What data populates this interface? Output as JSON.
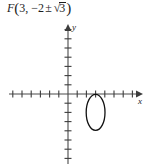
{
  "figure": {
    "annotation": {
      "function_name": "F",
      "open_paren": "(",
      "x_coordinate": "3",
      "separator": ", ",
      "y_base": "−2",
      "plus_minus": "±",
      "radical_sign": "√",
      "radicand": "3",
      "close_paren": ")",
      "full_text": "F(3, −2 ± √3)"
    },
    "axes": {
      "x_axis_label": "x",
      "y_axis_label": "y",
      "origin_px": {
        "x": 68,
        "y": 94
      },
      "tick_spacing_px": 9.2,
      "x_ticks_left": 7,
      "x_ticks_right": 7,
      "y_ticks_above": 7,
      "y_ticks_below": 7,
      "x_range": [
        -7,
        7
      ],
      "y_range": [
        -7,
        7
      ],
      "arrowheads": [
        "x-positive",
        "y-positive"
      ],
      "grid": false,
      "tick_labels_shown": false
    },
    "curve": {
      "type": "ellipse",
      "center": [
        3,
        -2
      ],
      "semi_major_axis_vertical": 2,
      "semi_minor_axis_horizontal": 1,
      "orientation": "vertical",
      "foci": [
        "(3, -2 + √3)",
        "(3, -2 - √3)"
      ],
      "bbox_px": {
        "x": 86,
        "y": 92,
        "width": 19,
        "height": 36
      }
    },
    "colors": {
      "background": "#ffffff",
      "axis": "#4a4a4a",
      "tick": "#3d3d3d",
      "curve": "#111111",
      "text": "#1d1d1d"
    }
  }
}
